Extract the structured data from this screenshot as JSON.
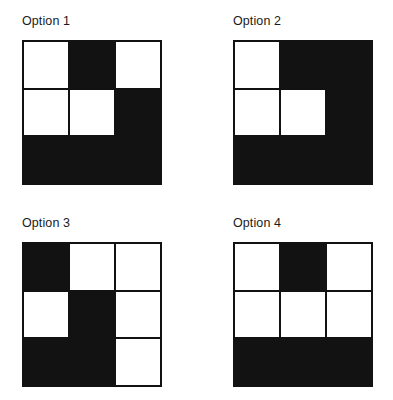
{
  "page": {
    "background_color": "#ffffff",
    "fill_color": "#121212",
    "empty_color": "#ffffff",
    "grid_line_color": "#121212",
    "grid_rows": 3,
    "grid_cols": 3
  },
  "options": [
    {
      "id": "option-1",
      "label": "Option 1",
      "grid": [
        [
          "white",
          "black",
          "white"
        ],
        [
          "white",
          "white",
          "black"
        ],
        [
          "black",
          "black",
          "black"
        ]
      ]
    },
    {
      "id": "option-2",
      "label": "Option 2",
      "grid": [
        [
          "white",
          "black",
          "black"
        ],
        [
          "white",
          "white",
          "black"
        ],
        [
          "black",
          "black",
          "black"
        ]
      ]
    },
    {
      "id": "option-3",
      "label": "Option 3",
      "grid": [
        [
          "black",
          "white",
          "white"
        ],
        [
          "white",
          "black",
          "white"
        ],
        [
          "black",
          "black",
          "white"
        ]
      ]
    },
    {
      "id": "option-4",
      "label": "Option 4",
      "grid": [
        [
          "white",
          "black",
          "white"
        ],
        [
          "white",
          "white",
          "white"
        ],
        [
          "black",
          "black",
          "black"
        ]
      ]
    }
  ]
}
